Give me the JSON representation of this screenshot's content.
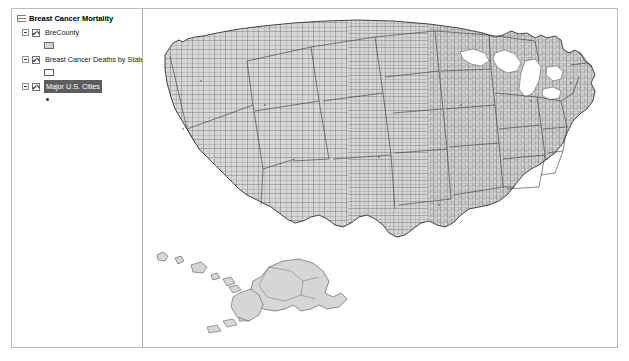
{
  "window": {
    "background_color": "#ffffff",
    "border_color": "#b9bcc0"
  },
  "toc": {
    "data_frame": {
      "icon": "data-frame-icon",
      "title": "Breast Cancer Mortality",
      "checked": true,
      "expanded": true
    },
    "layers": [
      {
        "name": "BreCounty",
        "checked": true,
        "expanded": true,
        "selected": false,
        "symbol": {
          "type": "polygon-fill",
          "fill_color": "#d2d2d2",
          "outline_color": "#6c6f73"
        }
      },
      {
        "name": "Breast Cancer Deaths by State",
        "checked": true,
        "expanded": true,
        "selected": false,
        "symbol": {
          "type": "polygon-hollow",
          "fill_color": "#ffffff",
          "outline_color": "#5b5e62"
        }
      },
      {
        "name": "Major U.S. Cities",
        "checked": true,
        "expanded": true,
        "selected": true,
        "selection_color": "#5d5d5d",
        "symbol": {
          "type": "point",
          "fill_color": "#2c2c2c"
        }
      }
    ]
  },
  "map": {
    "name": "united-states-county-map",
    "county_fill": "#d4d4d4",
    "county_outline": "#4a4a4a",
    "state_outline": "#2b2b2b",
    "background": "#ffffff",
    "extent_label": "Contiguous United States with Alaska and Hawaii insets"
  }
}
